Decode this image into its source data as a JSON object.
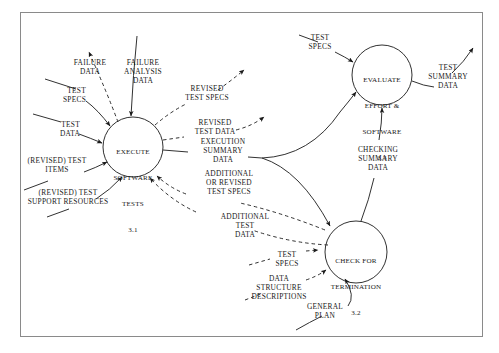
{
  "diagram": {
    "type": "data-flow-diagram",
    "frame": {
      "stroke": "#8a8a8a"
    },
    "line_color": "#1a1a1a",
    "background": "#ffffff"
  },
  "processes": [
    {
      "id": "p31",
      "name": "execute-software-tests",
      "line1": "EXECUTE",
      "line2": "SOFTWARE",
      "line3": "TESTS",
      "number": "3.1",
      "cx": 133,
      "cy": 147,
      "r": 30
    },
    {
      "id": "p33",
      "name": "evaluate-effort-and-software",
      "line1": "EVALUATE",
      "line2": "EFFORT &",
      "line3": "SOFTWARE",
      "number": "3.3",
      "cx": 382,
      "cy": 75,
      "r": 30
    },
    {
      "id": "p32",
      "name": "check-for-termination",
      "line1": "CHECK FOR",
      "line2": "TERMINATION",
      "line3": "",
      "number": "3.2",
      "cx": 356,
      "cy": 252,
      "r": 31
    }
  ],
  "flows": [
    {
      "id": "f1",
      "name": "failure-data",
      "text": "FAILURE\nDATA",
      "style": "dashed",
      "direction": "out"
    },
    {
      "id": "f2",
      "name": "failure-analysis-data",
      "text": "FAILURE\nANALYSIS\nDATA",
      "style": "solid",
      "direction": "in"
    },
    {
      "id": "f3",
      "name": "test-specs-left",
      "text": "TEST\nSPECS",
      "style": "solid",
      "direction": "in"
    },
    {
      "id": "f4",
      "name": "test-data-left",
      "text": "TEST\nDATA",
      "style": "solid",
      "direction": "in"
    },
    {
      "id": "f5",
      "name": "revised-test-items",
      "text": "(REVISED) TEST\nITEMS",
      "style": "solid",
      "direction": "in"
    },
    {
      "id": "f6",
      "name": "revised-test-support-resources",
      "text": "(REVISED) TEST\nSUPPORT RESOURCES",
      "style": "solid",
      "direction": "in"
    },
    {
      "id": "f7",
      "name": "revised-test-specs",
      "text": "REVISED\nTEST SPECS",
      "style": "dashed",
      "direction": "out"
    },
    {
      "id": "f8",
      "name": "revised-test-data",
      "text": "REVISED\nTEST DATA",
      "style": "dashed",
      "direction": "out"
    },
    {
      "id": "f9",
      "name": "execution-summary-data",
      "text": "EXECUTION\nSUMMARY\nDATA",
      "style": "solid",
      "direction": "out"
    },
    {
      "id": "f10",
      "name": "additional-or-revised-test-specs",
      "text": "ADDITIONAL\nOR REVISED\nTEST SPECS",
      "style": "dashed",
      "direction": "in"
    },
    {
      "id": "f11",
      "name": "additional-test-data",
      "text": "ADDITIONAL\nTEST\nDATA",
      "style": "dashed",
      "direction": "in"
    },
    {
      "id": "f12",
      "name": "test-specs-evaluate",
      "text": "TEST\nSPECS",
      "style": "solid",
      "direction": "in"
    },
    {
      "id": "f13",
      "name": "test-summary-data",
      "text": "TEST\nSUMMARY\nDATA",
      "style": "solid",
      "direction": "out"
    },
    {
      "id": "f14",
      "name": "checking-summary-data",
      "text": "CHECKING\nSUMMARY\nDATA",
      "style": "solid",
      "direction": "in"
    },
    {
      "id": "f15",
      "name": "test-specs-termination",
      "text": "TEST\nSPECS",
      "style": "dashed",
      "direction": "in"
    },
    {
      "id": "f16",
      "name": "data-structure-descriptions",
      "text": "DATA\nSTRUCTURE\nDESCRIPTIONS",
      "style": "dashed",
      "direction": "in"
    },
    {
      "id": "f17",
      "name": "general-plan",
      "text": "GENERAL\nPLAN",
      "style": "solid",
      "direction": "in"
    }
  ],
  "labels": {
    "failure_data": "FAILURE\nDATA",
    "failure_analysis_data": "FAILURE\nANALYSIS\nDATA",
    "test_specs_left": "TEST\nSPECS",
    "test_data_left": "TEST\nDATA",
    "revised_test_items": "(REVISED) TEST\nITEMS",
    "revised_test_support_resources": "(REVISED) TEST\nSUPPORT RESOURCES",
    "revised_test_specs": "REVISED\nTEST SPECS",
    "revised_test_data": "REVISED\nTEST DATA",
    "execution_summary_data": "EXECUTION\nSUMMARY\nDATA",
    "additional_or_revised_test_specs": "ADDITIONAL\nOR REVISED\nTEST SPECS",
    "additional_test_data": "ADDITIONAL\nTEST\nDATA",
    "test_specs_evaluate": "TEST\nSPECS",
    "test_summary_data": "TEST\nSUMMARY\nDATA",
    "checking_summary_data": "CHECKING\nSUMMARY\nDATA",
    "test_specs_termination": "TEST\nSPECS",
    "data_structure_descriptions": "DATA\nSTRUCTURE\nDESCRIPTIONS",
    "general_plan": "GENERAL\nPLAN"
  }
}
